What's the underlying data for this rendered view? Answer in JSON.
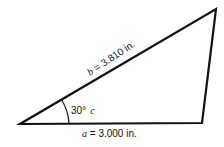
{
  "diagram": {
    "type": "triangle",
    "vertices": {
      "left": [
        20,
        124
      ],
      "right": [
        202,
        123
      ],
      "top": [
        216,
        9
      ]
    },
    "side_b": {
      "variable": "b",
      "text": " = 3.810 in."
    },
    "side_a": {
      "variable": "a",
      "text": " = 3.000 in."
    },
    "angle": {
      "value": "30°",
      "variable": "c"
    },
    "colors": {
      "stroke": "#111111",
      "background": "#ffffff"
    }
  }
}
